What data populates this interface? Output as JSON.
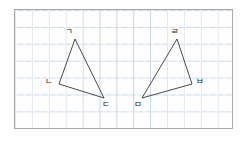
{
  "figure": {
    "background_color": "#ffffff",
    "panel": {
      "border_color": "#a9a9a9",
      "grid_color": "#c9d6e8",
      "grid_cell_px": 16.9,
      "x": 14,
      "y": 9,
      "width": 219,
      "height": 120
    },
    "stroke_color": "#4a4a4a",
    "shapes": [
      {
        "name": "triangle-left",
        "vertices": [
          {
            "label": "ㄱ",
            "x": 75,
            "y": 39,
            "label_x": 65,
            "label_y": 27
          },
          {
            "label": "ㄴ",
            "x": 59,
            "y": 84,
            "label_x": 45,
            "label_y": 77
          },
          {
            "label": "ㄷ",
            "x": 104,
            "y": 98,
            "label_x": 102,
            "label_y": 100
          }
        ]
      },
      {
        "name": "triangle-right",
        "vertices": [
          {
            "label": "ㄹ",
            "x": 177,
            "y": 39,
            "label_x": 171,
            "label_y": 27
          },
          {
            "label": "ㅁ",
            "x": 142,
            "y": 98,
            "label_x": 134,
            "label_y": 100
          },
          {
            "label": "ㅂ",
            "x": 192,
            "y": 84,
            "label_x": 196,
            "label_y": 77
          }
        ]
      }
    ]
  }
}
